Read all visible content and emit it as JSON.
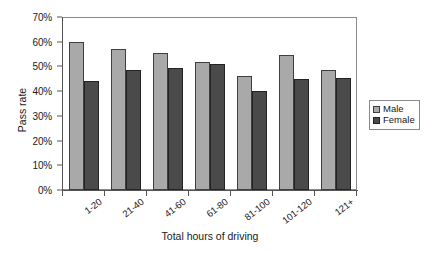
{
  "chart_data": {
    "type": "bar",
    "title": "",
    "xlabel": "Total hours of driving",
    "ylabel": "Pass rate",
    "categories": [
      "1-20",
      "21-40",
      "41-60",
      "61-80",
      "81-100",
      "101-120",
      "121+"
    ],
    "series": [
      {
        "name": "Male",
        "color": "#a9a9a9",
        "values": [
          60,
          57,
          55.5,
          52,
          46,
          54.5,
          48.5
        ]
      },
      {
        "name": "Female",
        "color": "#4a4a4a",
        "values": [
          44,
          48.5,
          49.5,
          51,
          40,
          45,
          45.5
        ]
      }
    ],
    "ylim": [
      0,
      70
    ],
    "ytick_values": [
      0,
      10,
      20,
      30,
      40,
      50,
      60,
      70
    ],
    "ytick_labels": [
      "0%",
      "10%",
      "20%",
      "30%",
      "40%",
      "50%",
      "60%",
      "70%"
    ],
    "grid": false,
    "legend_position": "right"
  },
  "legend": {
    "entries": [
      {
        "label": "Male"
      },
      {
        "label": "Female"
      }
    ]
  },
  "axes": {
    "y_title": "Pass rate",
    "x_title": "Total hours of driving"
  }
}
